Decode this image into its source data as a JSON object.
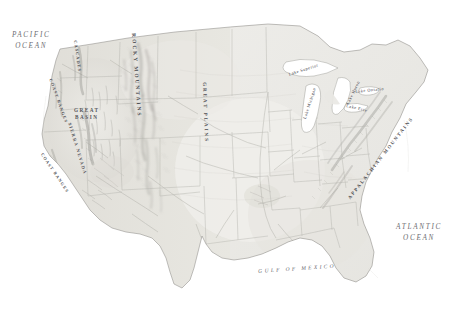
{
  "map": {
    "title": "Physical relief map of the contiguous United States",
    "background_color": "#ffffff",
    "land_base_color": "#e9e8e3",
    "relief_shadow_color": "#9a9a96",
    "border_line_color": "#b9b8b2",
    "coast_line_color": "#8e8d88",
    "water_color": "#ffffff"
  },
  "ocean_labels": [
    {
      "name": "pacific-ocean",
      "line1": "PACIFIC",
      "line2": "OCEAN",
      "x": 12,
      "y": 30
    },
    {
      "name": "atlantic-ocean",
      "line1": "ATLANTIC",
      "line2": "OCEAN",
      "x": 396,
      "y": 222
    }
  ],
  "gulf_label": {
    "name": "gulf-of-mexico",
    "text": "GULF OF MEXICO",
    "x": 258,
    "y": 268,
    "rotate": -4
  },
  "region_labels": [
    {
      "name": "great-basin",
      "line1": "GREAT",
      "line2": "BASIN",
      "x": 74,
      "y": 107
    }
  ],
  "range_labels": [
    {
      "name": "rocky-mountains",
      "text": "ROCKY MOUNTAINS",
      "x": 137,
      "y": 33,
      "rotate": 86,
      "size": 5.4,
      "spacing": 2.0
    },
    {
      "name": "great-plains",
      "text": "GREAT PLAINS",
      "x": 207,
      "y": 82,
      "rotate": 88,
      "size": 5.0,
      "spacing": 2.0
    },
    {
      "name": "appalachian-mountains",
      "text": "APPALACHIAN MOUNTAINS",
      "x": 347,
      "y": 197,
      "rotate": -52,
      "size": 4.9,
      "spacing": 1.7
    },
    {
      "name": "sierra-nevada",
      "text": "SIERRA NEVADA",
      "x": 72,
      "y": 122,
      "rotate": 73,
      "size": 4.6,
      "spacing": 1.3
    },
    {
      "name": "coast-ranges-north",
      "text": "COAST RANGES",
      "x": 53,
      "y": 78,
      "rotate": 70,
      "size": 4.3,
      "spacing": 1.1
    },
    {
      "name": "coast-ranges-south",
      "text": "COAST RANGES",
      "x": 44,
      "y": 152,
      "rotate": 56,
      "size": 4.3,
      "spacing": 1.1
    },
    {
      "name": "cascade-range",
      "text": "CASCADES",
      "x": 78,
      "y": 40,
      "rotate": 82,
      "size": 4.3,
      "spacing": 1.1
    }
  ],
  "lake_labels": [
    {
      "name": "lake-superior",
      "text": "Lake Superior",
      "x": 288,
      "y": 72,
      "rotate": -18
    },
    {
      "name": "lake-michigan",
      "text": "Lake Michigan",
      "x": 302,
      "y": 118,
      "rotate": -72
    },
    {
      "name": "lake-huron",
      "text": "Lake Huron",
      "x": 345,
      "y": 103,
      "rotate": -64
    },
    {
      "name": "lake-erie",
      "text": "Lake Erie",
      "x": 347,
      "y": 103,
      "rotate": 14
    },
    {
      "name": "lake-ontario",
      "text": "Lake Ontario",
      "x": 355,
      "y": 89,
      "rotate": -6
    }
  ]
}
